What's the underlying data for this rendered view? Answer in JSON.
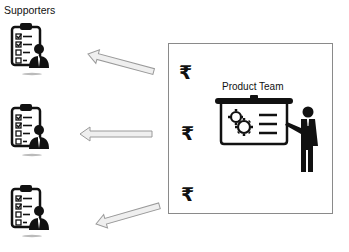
{
  "title": "Supporters",
  "team": {
    "label": "Product Team",
    "currency_symbols": [
      "₹",
      "₹",
      "₹"
    ]
  },
  "supporters": [
    {
      "icon": "clipboard-checklist-person-icon",
      "checked": [
        true,
        true,
        false,
        false
      ]
    },
    {
      "icon": "clipboard-checklist-person-icon",
      "checked": [
        true,
        true,
        false,
        false
      ]
    },
    {
      "icon": "clipboard-checklist-person-icon",
      "checked": [
        true,
        true,
        false,
        false
      ]
    }
  ],
  "arrows": [
    {
      "from": "product-team",
      "to": "supporter-1",
      "direction": "left-up"
    },
    {
      "from": "product-team",
      "to": "supporter-2",
      "direction": "left"
    },
    {
      "from": "product-team",
      "to": "supporter-3",
      "direction": "left-down"
    }
  ],
  "colors": {
    "icon": "#111111",
    "arrow_fill": "#efefef",
    "arrow_stroke": "#9a9a9a",
    "box_border": "#8a8a8a"
  }
}
